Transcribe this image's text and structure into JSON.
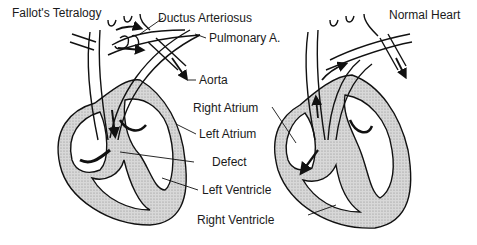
{
  "diagram": {
    "left_panel": {
      "title": "Fallot's Tetralogy",
      "labels": {
        "ductus": "Ductus Arteriosus",
        "pulmonary": "Pulmonary A.",
        "aorta": "Aorta",
        "right_atrium": "Right Atrium",
        "left_atrium": "Left Atrium",
        "defect": "Defect",
        "left_ventricle": "Left Ventricle",
        "right_ventricle": "Right Ventricle"
      }
    },
    "right_panel": {
      "title": "Normal Heart"
    },
    "colors": {
      "line": "#111111",
      "muscle_fill": "#cfcfcf",
      "background": "#ffffff"
    }
  }
}
